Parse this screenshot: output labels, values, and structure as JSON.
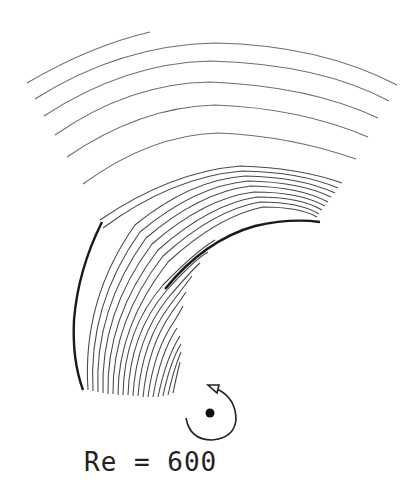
{
  "figure": {
    "label": "Re = 600",
    "rotation_icon": "counterclockwise-rotation-arrow"
  }
}
